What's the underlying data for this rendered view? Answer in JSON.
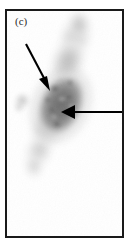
{
  "figure": {
    "panel_label": "(c)",
    "domain": "micrograph",
    "caption_visible": false,
    "background_color": "#ffffff",
    "frame_color": "#1a1a1a",
    "frame_width_px": 2,
    "panel_width_px": 133,
    "panel_height_px": 248
  },
  "image": {
    "name": "cell-micrograph",
    "description": "Grayscale autoradiograph / immunofluorescence micrograph of a single elongated cell with a dark stained oval nucleus and faint diffuse cytoplasmic tails extending up-right and down-left",
    "modality": "grayscale-brightfield",
    "stain_tone": "#6a6a6a",
    "nucleus": {
      "name": "stained-nucleus",
      "center_x_pct": 47,
      "center_y_pct": 42,
      "width_pct": 33,
      "height_pct": 30,
      "rotation_deg": 28,
      "core_darkness": "#5d5d5d"
    },
    "upper_tail": {
      "name": "upper-cytoplasm-tail",
      "tone": "#c8c8c8"
    },
    "lower_tail": {
      "name": "lower-cytoplasm-tail",
      "tone": "#d2d2d2"
    },
    "satellite_speck": {
      "name": "satellite-speck",
      "center_x_pct": 13,
      "center_y_pct": 40,
      "tone": "#c6c6c6"
    }
  },
  "annotations": {
    "arrow_color": "#000000",
    "items": [
      {
        "name": "arrow-upper-left",
        "label": "",
        "direction": "down-right",
        "tail_x_pct": 17,
        "tail_y_pct": 15,
        "tip_x_pct": 37,
        "tip_y_pct": 33,
        "points_to": "nucleus upper edge"
      },
      {
        "name": "arrow-right-horizontal",
        "label": "",
        "direction": "left",
        "tail_x_pct": 100,
        "tail_y_pct": 45,
        "tip_x_pct": 48,
        "tip_y_pct": 45,
        "points_to": "nucleus interior"
      }
    ]
  }
}
